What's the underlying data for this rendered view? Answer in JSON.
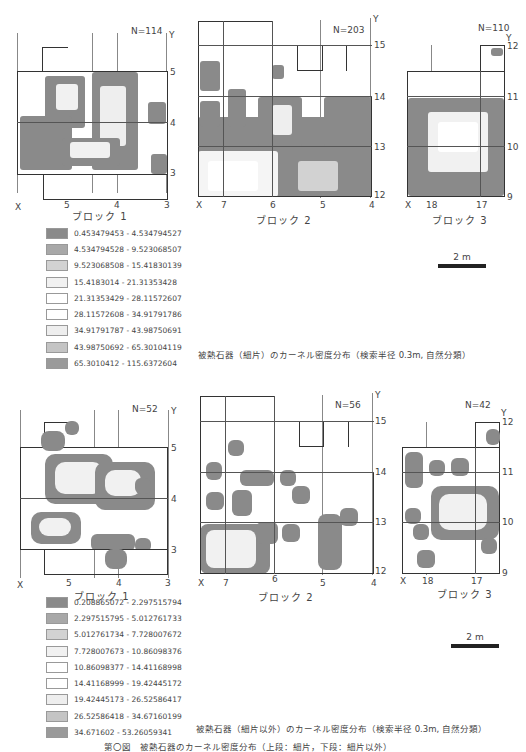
{
  "figure_top": {
    "caption": "被熱石器（細片）のカーネル密度分布（検索半径 0.3m, 自然分類）",
    "blocks": [
      {
        "name": "ブロック 1",
        "n_label": "N=114",
        "x_ticks": [
          "X",
          "5",
          "4",
          "3"
        ],
        "y_ticks": [
          "Y",
          "5",
          "4",
          "3"
        ]
      },
      {
        "name": "ブロック 2",
        "n_label": "N=203",
        "x_ticks": [
          "X",
          "7",
          "6",
          "5",
          "4"
        ],
        "y_ticks": [
          "Y",
          "15",
          "14",
          "13",
          "12"
        ]
      },
      {
        "name": "ブロック 3",
        "n_label": "N=110",
        "x_ticks": [
          "X",
          "18",
          "17"
        ],
        "y_ticks": [
          "Y",
          "12",
          "11",
          "10",
          "9"
        ]
      }
    ],
    "legend": [
      {
        "range": "0.453479453 - 4.534794527",
        "color": "#8a8a8a"
      },
      {
        "range": "4.534794528 - 9.523068507",
        "color": "#a8a8a8"
      },
      {
        "range": "9.523068508 - 15.41830139",
        "color": "#d2d2d2"
      },
      {
        "range": "15.4183014 - 21.31353428",
        "color": "#f1f1f1"
      },
      {
        "range": "21.31353429 - 28.11572607",
        "color": "#ffffff"
      },
      {
        "range": "28.11572608 - 34.91791786",
        "color": "#ffffff"
      },
      {
        "range": "34.91791787 - 43.98750691",
        "color": "#eeeeee"
      },
      {
        "range": "43.98750692 - 65.30104119",
        "color": "#c4c4c4"
      },
      {
        "range": "65.3010412 - 115.6372604",
        "color": "#9a9a9a"
      }
    ],
    "scale_bar": "2 m"
  },
  "figure_bottom": {
    "caption": "被熱石器（細片以外）のカーネル密度分布（検索半径 0.3m, 自然分類）",
    "blocks": [
      {
        "name": "ブロック 1",
        "n_label": "N=52",
        "x_ticks": [
          "X",
          "5",
          "4",
          "3"
        ],
        "y_ticks": [
          "Y",
          "5",
          "4",
          "3"
        ]
      },
      {
        "name": "ブロック 2",
        "n_label": "N=56",
        "x_ticks": [
          "X",
          "7",
          "6",
          "5",
          "4"
        ],
        "y_ticks": [
          "Y",
          "15",
          "14",
          "13",
          "12"
        ]
      },
      {
        "name": "ブロック 3",
        "n_label": "N=42",
        "x_ticks": [
          "X",
          "18",
          "17"
        ],
        "y_ticks": [
          "Y",
          "12",
          "11",
          "10",
          "9"
        ]
      }
    ],
    "legend": [
      {
        "range": "0.208865072 - 2.297515794",
        "color": "#8a8a8a"
      },
      {
        "range": "2.297515795 - 5.012761733",
        "color": "#a8a8a8"
      },
      {
        "range": "5.012761734 - 7.728007672",
        "color": "#d2d2d2"
      },
      {
        "range": "7.728007673 - 10.86098376",
        "color": "#f1f1f1"
      },
      {
        "range": "10.86098377 - 14.41168998",
        "color": "#ffffff"
      },
      {
        "range": "14.41168999 - 19.42445172",
        "color": "#ffffff"
      },
      {
        "range": "19.42445173 - 26.52586417",
        "color": "#eeeeee"
      },
      {
        "range": "26.52586418 - 34.67160199",
        "color": "#c4c4c4"
      },
      {
        "range": "34.671602 - 53.26059341",
        "color": "#9a9a9a"
      }
    ],
    "scale_bar": "2 m"
  },
  "figure_caption": "第〇図　被熱石器のカーネル密度分布（上段：細片，下段：細片以外）"
}
